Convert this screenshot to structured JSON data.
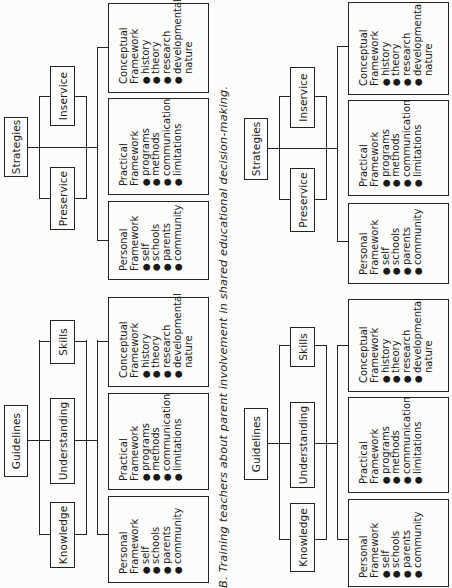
{
  "caption": "B.  Training teachers about parent involvement in shared educational decision-making.",
  "panels": {
    "guidelines_top": {
      "root": "Guidelines",
      "children": [
        "Knowledge",
        "Understanding",
        "Skills"
      ],
      "leaves": [
        {
          "title1": "Personal",
          "title2": "Framework",
          "items": [
            "self",
            "schools",
            "parents",
            "community"
          ]
        },
        {
          "title1": "Practical",
          "title2": "Framework",
          "items": [
            "programs",
            "methods",
            "communication",
            "limitations"
          ]
        },
        {
          "title1": "Conceptual",
          "title2": "Framework",
          "items": [
            "history",
            "theory",
            "research",
            "developmental"
          ],
          "continuation": "nature"
        }
      ]
    },
    "strategies_top": {
      "root": "Strategies",
      "children": [
        "Preservice",
        "Inservice"
      ],
      "leaves": [
        {
          "title1": "Personal",
          "title2": "Framework",
          "items": [
            "self",
            "schools",
            "parents",
            "community"
          ]
        },
        {
          "title1": "Practical",
          "title2": "Framework",
          "items": [
            "programs",
            "methods",
            "communication",
            "limitations"
          ]
        },
        {
          "title1": "Conceptual",
          "title2": "Framework",
          "items": [
            "history",
            "theory",
            "research",
            "developmental"
          ],
          "continuation": "nature"
        }
      ]
    },
    "guidelines_bottom": {
      "root": "Guidelines",
      "children": [
        "Knowledge",
        "Understanding",
        "Skills"
      ],
      "leaves": [
        {
          "title1": "Personal",
          "title2": "Framework",
          "items": [
            "self",
            "schools",
            "parents",
            "community"
          ]
        },
        {
          "title1": "Practical",
          "title2": "Framework",
          "items": [
            "programs",
            "methods",
            "communication",
            "limitations"
          ]
        },
        {
          "title1": "Conceptual",
          "title2": "Framework",
          "items": [
            "history",
            "theory",
            "research",
            "developmental"
          ],
          "continuation": "nature"
        }
      ]
    },
    "strategies_bottom": {
      "root": "Strategies",
      "children": [
        "Preservice",
        "Inservice"
      ],
      "leaves": [
        {
          "title1": "Personal",
          "title2": "Framework",
          "items": [
            "self",
            "schools",
            "parents",
            "community"
          ]
        },
        {
          "title1": "Practical",
          "title2": "Framework",
          "items": [
            "programs",
            "methods",
            "communication",
            "limitations"
          ]
        },
        {
          "title1": "Conceptual",
          "title2": "Framework",
          "items": [
            "history",
            "theory",
            "research",
            "developmental"
          ],
          "continuation": "nature"
        }
      ]
    }
  },
  "bullet_glyph": "●"
}
